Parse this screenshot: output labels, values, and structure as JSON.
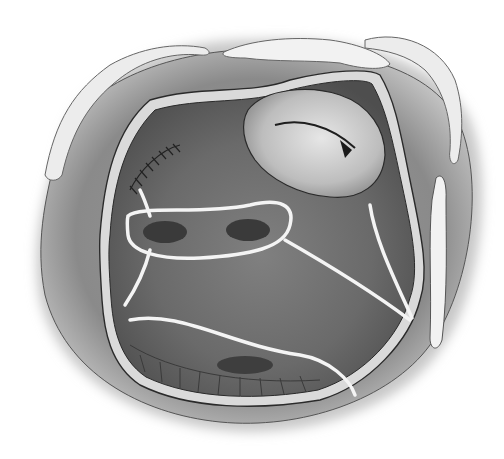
{
  "image": {
    "kind": "grayscale surgical illustration",
    "width": 504,
    "height": 459,
    "colors": {
      "background": "#ffffff",
      "outer_tissue": "#8a8a8a",
      "outer_tissue_light": "#b5b5b5",
      "inner_cavity": "#6e6e6e",
      "inner_cavity_dark": "#4a4a4a",
      "rim_wall": "#d8d8d8",
      "outline": "#2a2a2a",
      "fat_tissue": "#efefef",
      "suture_line": "#f2f2f2",
      "orifice": "#3a3a3a",
      "valve_fold": "#c9c9c9"
    }
  }
}
